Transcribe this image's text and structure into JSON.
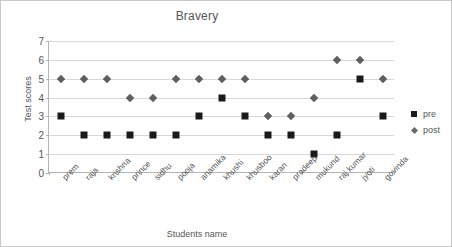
{
  "chart_data": {
    "type": "scatter",
    "title": "Bravery",
    "xlabel": "Students name",
    "ylabel": "Test scores",
    "ylim": [
      0,
      7
    ],
    "yticks": [
      0,
      1,
      2,
      3,
      4,
      5,
      6,
      7
    ],
    "grid": true,
    "legend_position": "right",
    "categories": [
      "prem",
      "raja",
      "krishna",
      "prince",
      "sidhu",
      "pooja",
      "anamika",
      "khushi",
      "khusboo",
      "karan",
      "pradeep",
      "mukund",
      "raj kumar",
      "jyoti",
      "govinda"
    ],
    "series": [
      {
        "name": "pre",
        "marker": "square",
        "color": "#1a1a1a",
        "values": [
          3,
          2,
          2,
          2,
          2,
          2,
          3,
          4,
          3,
          2,
          2,
          1,
          2,
          5,
          3
        ]
      },
      {
        "name": "post",
        "marker": "diamond",
        "color": "#5f5f5f",
        "values": [
          5,
          5,
          5,
          4,
          4,
          5,
          5,
          5,
          5,
          3,
          3,
          4,
          6,
          6,
          5
        ]
      }
    ]
  },
  "legend": {
    "items": [
      {
        "label": "pre"
      },
      {
        "label": "post"
      }
    ]
  }
}
